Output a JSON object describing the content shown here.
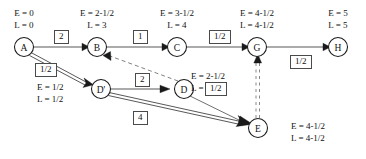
{
  "diagram": {
    "type": "activity-on-arrow-network",
    "nodes": [
      {
        "id": "A",
        "label": "A",
        "cx": 24,
        "cy": 47,
        "r": 9.5,
        "annotation": {
          "E": "E = 0",
          "L": "L = 0",
          "pos": "above",
          "tx": 24,
          "ty": 10
        }
      },
      {
        "id": "B",
        "label": "B",
        "cx": 97,
        "cy": 47,
        "r": 9.5,
        "annotation": {
          "E": "E = 2-1/2",
          "L": "L = 3",
          "pos": "above",
          "tx": 97,
          "ty": 10
        }
      },
      {
        "id": "C",
        "label": "C",
        "cx": 177,
        "cy": 47,
        "r": 9.5,
        "annotation": {
          "E": "E = 3-1/2",
          "L": "L = 4",
          "pos": "above",
          "tx": 177,
          "ty": 10
        }
      },
      {
        "id": "G",
        "label": "G",
        "cx": 257,
        "cy": 47,
        "r": 9.5,
        "annotation": {
          "E": "E = 4-1/2",
          "L": "L = 4-1/2",
          "pos": "above",
          "tx": 257,
          "ty": 10
        }
      },
      {
        "id": "H",
        "label": "H",
        "cx": 338,
        "cy": 47,
        "r": 9.5,
        "annotation": {
          "E": "E = 5",
          "L": "L = 5",
          "pos": "above",
          "tx": 338,
          "ty": 10
        }
      },
      {
        "id": "D2",
        "label": "D'",
        "cx": 101,
        "cy": 89,
        "r": 9.5,
        "annotation": {
          "E": "E = 1/2",
          "L": "L = 1/2",
          "pos": "left",
          "tx": 38,
          "ty": 83
        }
      },
      {
        "id": "D",
        "label": "D",
        "cx": 184,
        "cy": 89,
        "r": 9.5,
        "annotation": {
          "E": "E = 2-1/2",
          "L": "L = 3",
          "pos": "right",
          "tx": 192,
          "ty": 72
        }
      },
      {
        "id": "E",
        "label": "E",
        "cx": 258,
        "cy": 128,
        "r": 9.5,
        "annotation": {
          "E": "E = 4-1/2",
          "L": "L = 4-1/2",
          "pos": "right",
          "tx": 292,
          "ty": 122
        }
      }
    ],
    "edges": [
      {
        "from": "A",
        "to": "B",
        "duration": "2",
        "style": "single",
        "label_x": 56,
        "label_y": 33
      },
      {
        "from": "B",
        "to": "C",
        "duration": "1",
        "style": "single",
        "label_x": 136,
        "label_y": 33
      },
      {
        "from": "C",
        "to": "G",
        "duration": "1/2",
        "style": "single",
        "label_x": 216,
        "label_y": 33
      },
      {
        "from": "G",
        "to": "H",
        "duration": "1/2",
        "style": "single",
        "label_x": 297,
        "label_y": 58
      },
      {
        "from": "A",
        "to": "D2",
        "duration": "1/2",
        "style": "double",
        "label_x": 42,
        "label_y": 66
      },
      {
        "from": "D2",
        "to": "D",
        "duration": "2",
        "style": "single",
        "label_x": 141,
        "label_y": 76
      },
      {
        "from": "D2",
        "to": "E",
        "duration": "4",
        "style": "double",
        "label_x": 139,
        "label_y": 115
      },
      {
        "from": "D",
        "to": "E",
        "duration": "1/2",
        "style": "single",
        "label_x": 212,
        "label_y": 83
      },
      {
        "from": "E",
        "to": "G",
        "duration": "",
        "style": "dummy-vertical",
        "label_x": null,
        "label_y": null
      },
      {
        "from": "D",
        "to": "B",
        "duration": "",
        "style": "dashed",
        "label_x": null,
        "label_y": null
      }
    ],
    "legend": {
      "E_meaning": "E",
      "L_meaning": "L"
    }
  }
}
